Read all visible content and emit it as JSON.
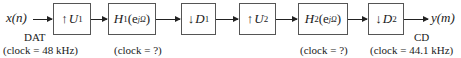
{
  "diagram": {
    "input_signal": "x(n)",
    "output_signal": "y(m)",
    "blocks": [
      {
        "id": "up1",
        "arrow": "↑",
        "symbol": "U",
        "sub": "1"
      },
      {
        "id": "h1",
        "symbol": "H",
        "sub": "1",
        "arg": "(e",
        "sup": "jΩ",
        "close": ")"
      },
      {
        "id": "down1",
        "arrow": "↓",
        "symbol": "D",
        "sub": "1"
      },
      {
        "id": "up2",
        "arrow": "↑",
        "symbol": "U",
        "sub": "2"
      },
      {
        "id": "h2",
        "symbol": "H",
        "sub": "2",
        "arg": "(e",
        "sup": "jΩ",
        "close": ")"
      },
      {
        "id": "down2",
        "arrow": "↓",
        "symbol": "D",
        "sub": "2"
      }
    ],
    "labels": {
      "source_name": "DAT",
      "source_clock": "(clock = 48 kHz)",
      "h1_clock": "(clock = ?)",
      "h2_clock": "(clock = ?)",
      "dest_name": "CD",
      "dest_clock": "(clock = 44.1 kHz)"
    }
  }
}
